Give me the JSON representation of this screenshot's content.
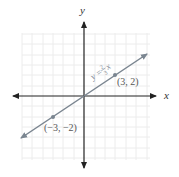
{
  "axes": {
    "x_label": "x",
    "y_label": "y"
  },
  "line": {
    "equation_prefix": "y = ",
    "numerator": "2",
    "denominator": "3",
    "equation_suffix": "x",
    "color": "#7a8590"
  },
  "points": [
    {
      "label": "(3, 2)",
      "x": 3,
      "y": 2
    },
    {
      "label": "(−3, −2)",
      "x": -3,
      "y": -2
    }
  ],
  "grid": {
    "color": "#ececec",
    "units_per_cell": 1
  }
}
